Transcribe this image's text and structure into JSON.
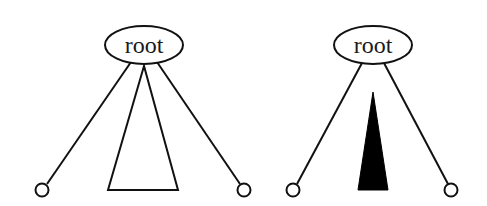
{
  "diagram": {
    "type": "tree-comparison",
    "colors": {
      "stroke": "#111111",
      "background": "#ffffff",
      "filled_subtree": "#000000"
    },
    "trees": [
      {
        "id": "left",
        "root_label": "root",
        "subtree_style": "outline-triangle",
        "children": [
          "leaf",
          "subtree",
          "leaf"
        ]
      },
      {
        "id": "right",
        "root_label": "root",
        "subtree_style": "filled-narrow-triangle",
        "children": [
          "leaf",
          "subtree",
          "leaf"
        ]
      }
    ]
  }
}
